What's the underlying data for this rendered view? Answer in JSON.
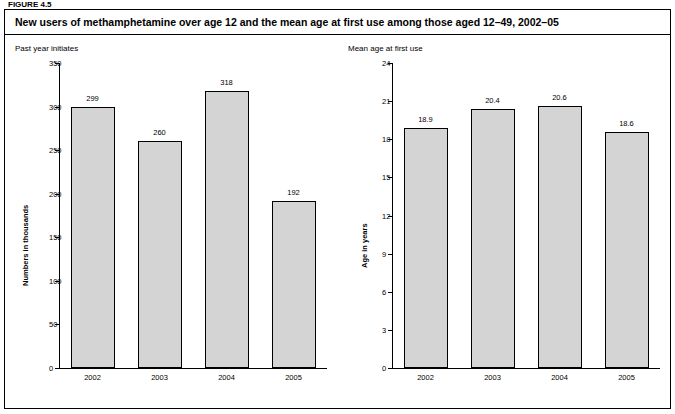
{
  "figure_label": "FIGURE 4.5",
  "title": "New users of methamphetamine over age 12 and the mean age at first use among those aged 12–49, 2002–05",
  "chart_data": [
    {
      "type": "bar",
      "title": "Past year initiates",
      "categories": [
        "2002",
        "2003",
        "2004",
        "2005"
      ],
      "values": [
        299,
        260,
        318,
        192
      ],
      "value_labels": [
        "299",
        "260",
        "318",
        "192"
      ],
      "xlabel": "",
      "ylabel": "Numbers in thousands",
      "ylim": [
        0,
        350
      ],
      "yticks": [
        0,
        50,
        100,
        150,
        200,
        250,
        300,
        350
      ],
      "ytick_labels": [
        "0",
        "50",
        "100",
        "150",
        "200",
        "250",
        "300",
        "350"
      ],
      "grid": false,
      "legend": "none",
      "bar_color": "#d4d4d4",
      "bar_edge_color": "#000000"
    },
    {
      "type": "bar",
      "title": "Mean age at first use",
      "categories": [
        "2002",
        "2003",
        "2004",
        "2005"
      ],
      "values": [
        18.9,
        20.4,
        20.6,
        18.6
      ],
      "value_labels": [
        "18.9",
        "20.4",
        "20.6",
        "18.6"
      ],
      "xlabel": "",
      "ylabel": "Age in years",
      "ylim": [
        0,
        24
      ],
      "yticks": [
        0,
        3,
        6,
        9,
        12,
        15,
        18,
        21,
        24
      ],
      "ytick_labels": [
        "0",
        "3",
        "6",
        "9",
        "12",
        "15",
        "18",
        "21",
        "24"
      ],
      "grid": false,
      "legend": "none",
      "bar_color": "#d4d4d4",
      "bar_edge_color": "#000000"
    }
  ]
}
